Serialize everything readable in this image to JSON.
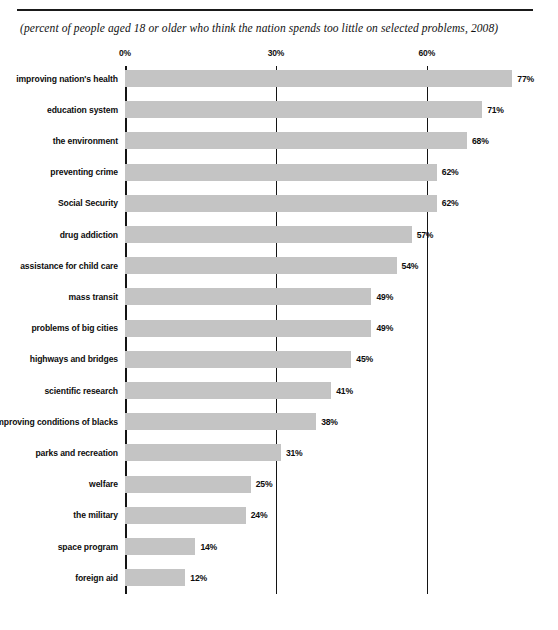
{
  "chart_data": {
    "type": "bar",
    "orientation": "horizontal",
    "title": "",
    "subtitle": "(percent of people aged 18 or older who think the nation spends too little on selected problems, 2008)",
    "xlabel": "",
    "ylabel": "",
    "xlim": [
      0,
      80
    ],
    "xticks": [
      "0%",
      "30%",
      "60%"
    ],
    "xtick_values": [
      0,
      30,
      60
    ],
    "grid": true,
    "legend": false,
    "value_suffix": "%",
    "bar_color": "#c4c4c4",
    "axis_color": "#141414",
    "categories": [
      "improving nation's health",
      "education system",
      "the environment",
      "preventing crime",
      "Social Security",
      "drug addiction",
      "assistance for child care",
      "mass transit",
      "problems of big cities",
      "highways and bridges",
      "scientific research",
      "improving conditions of blacks",
      "parks and recreation",
      "welfare",
      "the military",
      "space program",
      "foreign aid"
    ],
    "values": [
      77,
      71,
      68,
      62,
      62,
      57,
      54,
      49,
      49,
      45,
      41,
      38,
      31,
      25,
      24,
      14,
      12
    ],
    "value_labels": [
      "77%",
      "71%",
      "68%",
      "62%",
      "62%",
      "57%",
      "54%",
      "49%",
      "49%",
      "45%",
      "41%",
      "38%",
      "31%",
      "25%",
      "24%",
      "14%",
      "12%"
    ]
  }
}
